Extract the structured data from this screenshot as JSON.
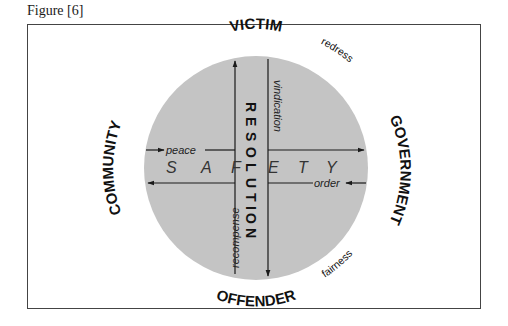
{
  "figure": {
    "caption": "Figure [6]"
  },
  "diagram": {
    "colors": {
      "circle_fill": "#c4c4c4",
      "line": "#1a1a1a",
      "frame": "#444444"
    },
    "outer_labels": {
      "top": "VICTIM",
      "bottom": "OFFENDER",
      "left": "COMMUNITY",
      "right": "GOVERNMENT"
    },
    "diagonal_labels": {
      "top_right": "redress",
      "bottom_right": "fairness"
    },
    "arrow_labels": {
      "top": "vindication",
      "left": "peace",
      "right": "order",
      "bottom": "recompense"
    },
    "center_vertical": "RESOLUTION",
    "center_horizontal": "SAFETY",
    "center_vertical_letters": [
      "R",
      "E",
      "S",
      "O",
      "L",
      "U",
      "T",
      "I",
      "O",
      "N"
    ],
    "center_horizontal_letters": [
      "S",
      "A",
      "F",
      "E",
      "T",
      "Y"
    ]
  }
}
